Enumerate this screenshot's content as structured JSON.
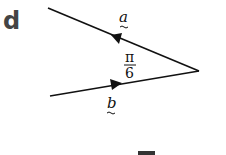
{
  "part_label": "d",
  "vectors": {
    "a": {
      "label": "a",
      "underline": "tilde"
    },
    "b": {
      "label": "b",
      "underline": "tilde"
    }
  },
  "angle": {
    "numerator": "π",
    "denominator": "6"
  },
  "colors": {
    "line": "#111111",
    "part_label": "#444444",
    "background": "#ffffff"
  }
}
